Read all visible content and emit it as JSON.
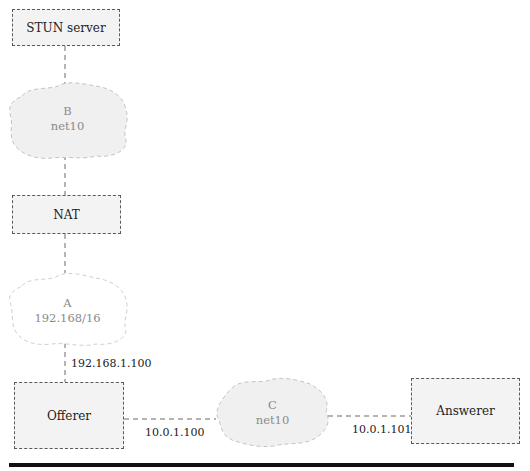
{
  "nodes": {
    "stun": {
      "label": "STUN server"
    },
    "nat": {
      "label": "NAT"
    },
    "offerer": {
      "label": "Offerer"
    },
    "answerer": {
      "label": "Answerer"
    }
  },
  "networks": {
    "b": {
      "name": "B",
      "subnet": "net10",
      "filled": true
    },
    "a": {
      "name": "A",
      "subnet": "192.168/16",
      "filled": false
    },
    "c": {
      "name": "C",
      "subnet": "net10",
      "filled": true
    }
  },
  "addresses": {
    "offerer_a": "192.168.1.100",
    "offerer_c": "10.0.1.100",
    "answerer_c": "10.0.1.101"
  },
  "colors": {
    "box_fill": "#f3f3f3",
    "box_border": "#5a5a5a",
    "cloud_fill": "#f0f0f0",
    "cloud_border": "#c4c4c4",
    "cloud_text": "#8a8a8a",
    "connector": "#6a6a6a"
  }
}
